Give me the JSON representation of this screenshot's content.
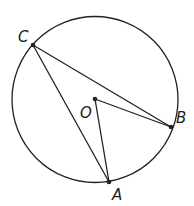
{
  "diagram": {
    "type": "circle-geometry",
    "circle": {
      "cx": 95,
      "cy": 99,
      "r": 83
    },
    "points": {
      "C": {
        "label": "C",
        "x": 33,
        "y": 45,
        "label_x": 18,
        "label_y": 42
      },
      "O": {
        "label": "O",
        "x": 95,
        "y": 99,
        "label_x": 80,
        "label_y": 118
      },
      "B": {
        "label": "B",
        "x": 171,
        "y": 127,
        "label_x": 176,
        "label_y": 123
      },
      "A": {
        "label": "A",
        "x": 109,
        "y": 182,
        "label_x": 112,
        "label_y": 200
      }
    },
    "segments": [
      [
        "C",
        "B"
      ],
      [
        "C",
        "A"
      ],
      [
        "O",
        "B"
      ],
      [
        "O",
        "A"
      ]
    ],
    "stroke_color": "#222222"
  }
}
